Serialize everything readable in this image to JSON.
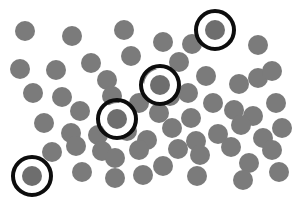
{
  "figure": {
    "width": 295,
    "height": 204,
    "background_color": "#ffffff",
    "dot_color": "#7b7b7b",
    "marked_dot_color": "#6e6e6e",
    "ring_color": "#0d0d0d",
    "gap_color": "#ffffff",
    "dot_diameter": 20,
    "ring_outer_diameter": 42,
    "ring_border_width": 4,
    "gap_diameter": 33,
    "total_dots": 59,
    "marked_count": 4
  },
  "chart_data": {
    "type": "scatter",
    "title": "",
    "xlabel": "",
    "ylabel": "",
    "xlim": [
      0,
      295
    ],
    "ylim": [
      0,
      204
    ],
    "grid": false,
    "legend": "none",
    "series": [
      {
        "name": "dots",
        "marker": "circle",
        "color": "#7b7b7b",
        "size": 20,
        "points": [
          [
            25,
            31
          ],
          [
            72,
            36
          ],
          [
            124,
            30
          ],
          [
            163,
            42
          ],
          [
            192,
            44
          ],
          [
            258,
            45
          ],
          [
            20,
            69
          ],
          [
            56,
            70
          ],
          [
            91,
            63
          ],
          [
            107,
            80
          ],
          [
            131,
            56
          ],
          [
            152,
            78
          ],
          [
            179,
            62
          ],
          [
            188,
            93
          ],
          [
            206,
            76
          ],
          [
            239,
            84
          ],
          [
            258,
            78
          ],
          [
            272,
            71
          ],
          [
            33,
            93
          ],
          [
            62,
            97
          ],
          [
            80,
            111
          ],
          [
            112,
            96
          ],
          [
            139,
            103
          ],
          [
            159,
            113
          ],
          [
            170,
            96
          ],
          [
            191,
            118
          ],
          [
            213,
            103
          ],
          [
            234,
            110
          ],
          [
            253,
            116
          ],
          [
            276,
            103
          ],
          [
            44,
            123
          ],
          [
            71,
            133
          ],
          [
            98,
            135
          ],
          [
            127,
            131
          ],
          [
            147,
            140
          ],
          [
            172,
            128
          ],
          [
            196,
            141
          ],
          [
            218,
            134
          ],
          [
            241,
            125
          ],
          [
            263,
            138
          ],
          [
            282,
            128
          ],
          [
            52,
            152
          ],
          [
            76,
            146
          ],
          [
            102,
            151
          ],
          [
            115,
            158
          ],
          [
            115,
            178
          ],
          [
            139,
            150
          ],
          [
            163,
            166
          ],
          [
            178,
            149
          ],
          [
            200,
            155
          ],
          [
            231,
            147
          ],
          [
            249,
            163
          ],
          [
            272,
            150
          ],
          [
            82,
            172
          ],
          [
            143,
            175
          ],
          [
            197,
            176
          ],
          [
            243,
            180
          ],
          [
            279,
            172
          ]
        ]
      },
      {
        "name": "marked-dots",
        "marker": "circle-with-ring",
        "color": "#6e6e6e",
        "ring_color": "#0d0d0d",
        "size": 20,
        "points": [
          [
            215,
            30
          ],
          [
            160,
            85
          ],
          [
            117,
            119
          ],
          [
            32,
            176
          ]
        ]
      }
    ]
  }
}
